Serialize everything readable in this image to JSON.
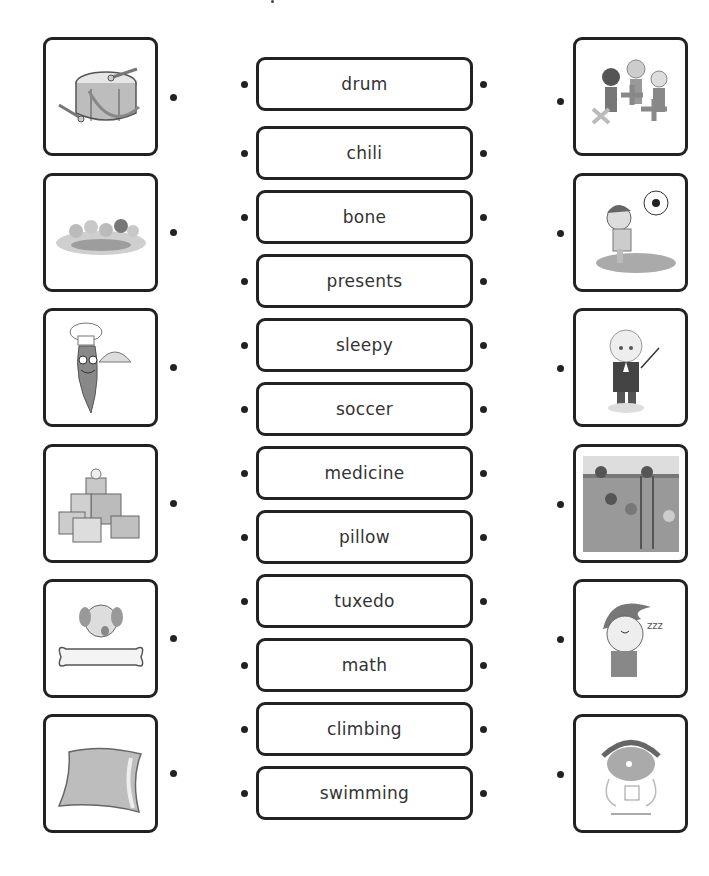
{
  "worksheet": {
    "words": [
      "drum",
      "chili",
      "bone",
      "presents",
      "sleepy",
      "soccer",
      "medicine",
      "pillow",
      "tuxedo",
      "math",
      "climbing",
      "swimming"
    ],
    "left_pictures": [
      {
        "name": "drum-picture",
        "depicts": "drum"
      },
      {
        "name": "swimming-picture",
        "depicts": "swimming"
      },
      {
        "name": "chili-picture",
        "depicts": "chili"
      },
      {
        "name": "presents-picture",
        "depicts": "presents"
      },
      {
        "name": "bone-picture",
        "depicts": "bone"
      },
      {
        "name": "pillow-picture",
        "depicts": "pillow"
      }
    ],
    "right_pictures": [
      {
        "name": "math-picture",
        "depicts": "math"
      },
      {
        "name": "soccer-picture",
        "depicts": "soccer"
      },
      {
        "name": "tuxedo-picture",
        "depicts": "tuxedo"
      },
      {
        "name": "climbing-picture",
        "depicts": "climbing"
      },
      {
        "name": "sleepy-picture",
        "depicts": "sleepy"
      },
      {
        "name": "medicine-picture",
        "depicts": "medicine"
      }
    ]
  },
  "colors": {
    "border": "#222222",
    "text": "#333333",
    "fill_gray": "#b5b5b5"
  }
}
